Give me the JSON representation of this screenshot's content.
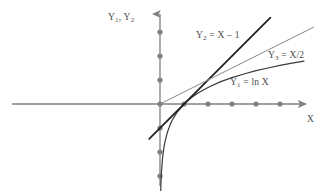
{
  "chart_data": {
    "type": "line",
    "title": "",
    "xlabel": "X",
    "ylabel": "Y1, Y2",
    "xlim": [
      -3.1,
      7.2
    ],
    "ylim": [
      -4.4,
      3.6
    ],
    "grid": false,
    "legend_position": "inline-annotations",
    "axis_color": "#808080",
    "curve_color": "#3a3a3a",
    "marker_color": "#808080",
    "x_axis_ticks": [
      1,
      2,
      3,
      4,
      5
    ],
    "y_axis_ticks": [
      -4,
      -3,
      -2,
      -1,
      1,
      2,
      3
    ],
    "series": [
      {
        "name": "Y1 = ln X",
        "label": "Y₁ = ln X",
        "expression": "ln X",
        "color": "#3a3a3a",
        "width": 1.2,
        "x": [
          0.02,
          0.05,
          0.1,
          0.15,
          0.2,
          0.3,
          0.4,
          0.5,
          0.7,
          1.0,
          1.3,
          1.6,
          2.0,
          2.5,
          3.0,
          3.5,
          4.0,
          4.5,
          5.0,
          5.5,
          6.0
        ],
        "y": [
          -3.91,
          -3.0,
          -2.3,
          -1.9,
          -1.61,
          -1.2,
          -0.92,
          -0.69,
          -0.36,
          0.0,
          0.26,
          0.47,
          0.69,
          0.92,
          1.1,
          1.25,
          1.39,
          1.5,
          1.61,
          1.7,
          1.79
        ]
      },
      {
        "name": "Y2 = X - 1",
        "label": "Y₂ = X – 1",
        "expression": "X - 1",
        "color": "#1f1f1f",
        "width": 1.7,
        "x": [
          -0.45,
          4.6
        ],
        "y": [
          -1.45,
          3.6
        ]
      },
      {
        "name": "Y3 = X/2",
        "label": "Y₃ = X/2",
        "expression": "X/2",
        "color": "#8a8a8a",
        "width": 1.0,
        "x": [
          0.0,
          6.4
        ],
        "y": [
          0.0,
          3.2
        ]
      }
    ]
  },
  "axes": {
    "y_axis_label": "Y₁, Y₂",
    "x_axis_label": "X"
  },
  "annotations": {
    "y2_label": "Y₂ = X – 1",
    "y3_label": "Y₃ = X/2",
    "y1_label": "Y₁ = ln X"
  }
}
